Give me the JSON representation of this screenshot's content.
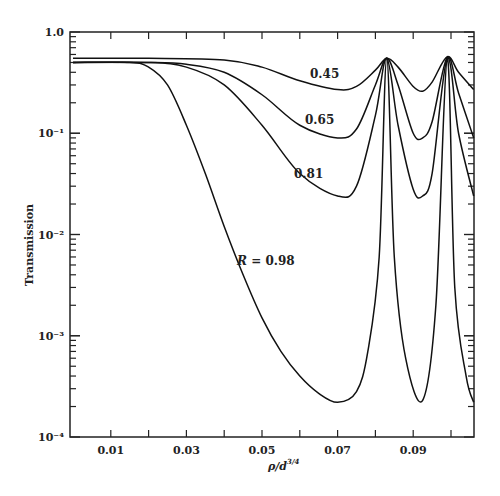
{
  "chart_data": {
    "type": "line",
    "title": "",
    "xlabel": "ρ/d^(3/4)",
    "ylabel": "Transmission",
    "yscale": "log",
    "xlim": [
      0.0,
      0.106
    ],
    "ylim": [
      0.0001,
      1.0
    ],
    "grid": false,
    "x_ticks": [
      0.01,
      0.03,
      0.05,
      0.07,
      0.09
    ],
    "x_tick_labels": [
      "0.01",
      "0.03",
      "0.05",
      "0.07",
      "0.09"
    ],
    "y_tick_labels": [
      "1.0",
      "10⁻¹",
      "10⁻²",
      "10⁻³",
      "10⁻⁴"
    ],
    "series": [
      {
        "name": "R = 0.45",
        "label": "0.45",
        "x": [
          0.0,
          0.02,
          0.04,
          0.05,
          0.06,
          0.07,
          0.075,
          0.08,
          0.083,
          0.086,
          0.09,
          0.0925,
          0.095,
          0.099,
          0.102,
          0.106
        ],
        "y": [
          0.55,
          0.55,
          0.53,
          0.45,
          0.33,
          0.27,
          0.29,
          0.42,
          0.55,
          0.45,
          0.29,
          0.26,
          0.32,
          0.57,
          0.4,
          0.27
        ]
      },
      {
        "name": "R = 0.65",
        "label": "0.65",
        "x": [
          0.0,
          0.02,
          0.03,
          0.04,
          0.05,
          0.06,
          0.07,
          0.075,
          0.08,
          0.083,
          0.086,
          0.09,
          0.0925,
          0.095,
          0.099,
          0.102,
          0.106
        ],
        "y": [
          0.5,
          0.5,
          0.48,
          0.4,
          0.24,
          0.12,
          0.09,
          0.11,
          0.3,
          0.55,
          0.3,
          0.1,
          0.09,
          0.13,
          0.56,
          0.25,
          0.09
        ]
      },
      {
        "name": "R = 0.81",
        "label": "0.81",
        "x": [
          0.0,
          0.02,
          0.03,
          0.04,
          0.05,
          0.06,
          0.07,
          0.075,
          0.08,
          0.083,
          0.086,
          0.09,
          0.0925,
          0.095,
          0.099,
          0.102,
          0.106
        ],
        "y": [
          0.5,
          0.5,
          0.45,
          0.3,
          0.12,
          0.04,
          0.024,
          0.03,
          0.15,
          0.55,
          0.12,
          0.028,
          0.024,
          0.04,
          0.55,
          0.1,
          0.024
        ]
      },
      {
        "name": "R = 0.98",
        "label": "R = 0.98",
        "x": [
          0.0,
          0.015,
          0.02,
          0.025,
          0.03,
          0.035,
          0.04,
          0.045,
          0.05,
          0.055,
          0.06,
          0.065,
          0.07,
          0.075,
          0.078,
          0.081,
          0.083,
          0.085,
          0.088,
          0.0925,
          0.096,
          0.099,
          0.101,
          0.104,
          0.106
        ],
        "y": [
          0.5,
          0.5,
          0.45,
          0.3,
          0.12,
          0.04,
          0.012,
          0.004,
          0.0015,
          0.0007,
          0.0004,
          0.00027,
          0.00022,
          0.00028,
          0.0007,
          0.006,
          0.55,
          0.006,
          0.0006,
          0.00023,
          0.002,
          0.55,
          0.003,
          0.0004,
          0.00022
        ]
      }
    ],
    "annotations": [
      "0.45",
      "0.65",
      "0.81",
      "R = 0.98"
    ]
  }
}
